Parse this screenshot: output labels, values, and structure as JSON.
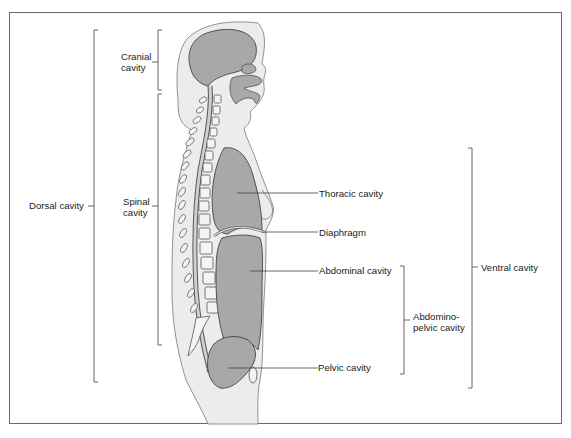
{
  "diagram": {
    "title": "",
    "colors": {
      "frame": "#6a6a6a",
      "body_fill": "#ececec",
      "cavity_fill": "#a8a8a8",
      "outline": "#555555",
      "leader_line": "#444444",
      "text": "#222222"
    },
    "labels": {
      "cranial_line1": "Cranial",
      "cranial_line2": "cavity",
      "spinal_line1": "Spinal",
      "spinal_line2": "cavity",
      "dorsal": "Dorsal cavity",
      "thoracic": "Thoracic cavity",
      "diaphragm": "Diaphragm",
      "abdominal": "Abdominal cavity",
      "abdomino_line1": "Abdomino-",
      "abdomino_line2": "pelvic cavity",
      "pelvic": "Pelvic cavity",
      "ventral": "Ventral cavity"
    },
    "groupings": [
      {
        "bracket": "Dorsal cavity",
        "contains": [
          "Cranial cavity",
          "Spinal cavity"
        ]
      },
      {
        "bracket": "Ventral cavity",
        "contains": [
          "Thoracic cavity",
          "Abdominopelvic cavity"
        ]
      },
      {
        "bracket": "Abdominopelvic cavity",
        "contains": [
          "Abdominal cavity",
          "Pelvic cavity"
        ]
      }
    ]
  }
}
